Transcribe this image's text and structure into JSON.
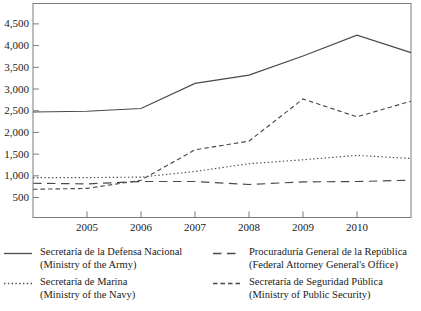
{
  "chart_data": {
    "type": "line",
    "x": [
      2004,
      2005,
      2006,
      2007,
      2008,
      2009,
      2010,
      2011
    ],
    "xlim": [
      2004,
      2011
    ],
    "ylim": [
      40,
      4970
    ],
    "grid": false,
    "legend_position": "bottom",
    "line_color": "#4a4a4a",
    "x_ticks": [
      {
        "v": 2005,
        "label": "2005"
      },
      {
        "v": 2006,
        "label": "2006"
      },
      {
        "v": 2007,
        "label": "2007"
      },
      {
        "v": 2008,
        "label": "2008"
      },
      {
        "v": 2009,
        "label": "2009"
      },
      {
        "v": 2010,
        "label": "2010"
      }
    ],
    "y_ticks": [
      {
        "v": 500,
        "label": "500"
      },
      {
        "v": 1000,
        "label": "1,000"
      },
      {
        "v": 1500,
        "label": "1,500"
      },
      {
        "v": 2000,
        "label": "2,000"
      },
      {
        "v": 2500,
        "label": "2,500"
      },
      {
        "v": 3000,
        "label": "3,000"
      },
      {
        "v": 3500,
        "label": "3,500"
      },
      {
        "v": 4000,
        "label": "4,000"
      },
      {
        "v": 4500,
        "label": "4,500"
      }
    ],
    "series": [
      {
        "id": "defensa-nacional",
        "name": "Secretaría de la Defensa Nacional",
        "subname": "(Ministry of the Army)",
        "style": "solid",
        "values": [
          2470,
          2490,
          2550,
          3130,
          3320,
          3760,
          4240,
          3840
        ]
      },
      {
        "id": "marina",
        "name": "Secretaría de Marina",
        "subname": "(Ministry of the Navy)",
        "style": "dotted",
        "values": [
          960,
          960,
          970,
          1100,
          1280,
          1370,
          1470,
          1400
        ]
      },
      {
        "id": "procuraduria-general",
        "name": "Procuraduría General de la República",
        "subname": "(Federal Attorney General's Office)",
        "style": "longdash",
        "values": [
          830,
          815,
          870,
          870,
          800,
          860,
          870,
          900
        ]
      },
      {
        "id": "seguridad-publica",
        "name": "Secretaría de Seguridad Pública",
        "subname": "(Ministry of Public Security)",
        "style": "shortdash",
        "values": [
          690,
          710,
          900,
          1600,
          1800,
          2770,
          2360,
          2720
        ]
      }
    ]
  }
}
